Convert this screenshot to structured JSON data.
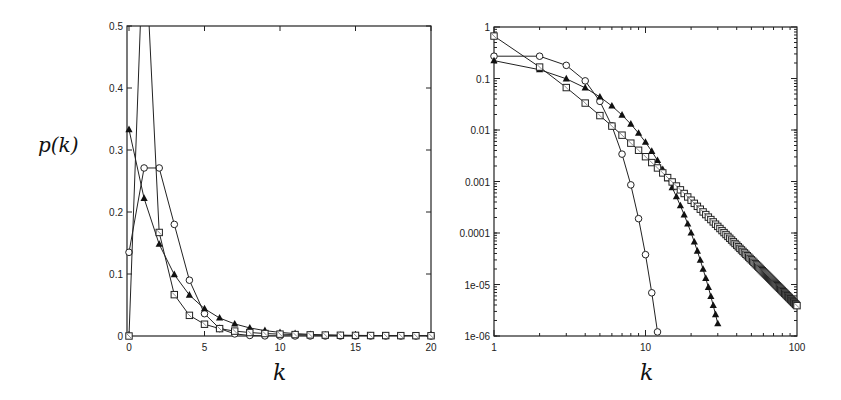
{
  "chart_data": [
    {
      "type": "line",
      "panel": "left",
      "title": "",
      "xlabel": "k",
      "ylabel": "p(k)",
      "xscale": "linear",
      "yscale": "linear",
      "xlim": [
        0,
        20
      ],
      "ylim": [
        0,
        0.5
      ],
      "xticks": [
        "0",
        "5",
        "10",
        "15",
        "20"
      ],
      "yticks": [
        "0",
        "0.1",
        "0.2",
        "0.3",
        "0.4",
        "0.5"
      ],
      "grid": false,
      "legend": null,
      "series": [
        {
          "name": "circles",
          "marker": "circle",
          "x": [
            0,
            1,
            2,
            3,
            4,
            5,
            6,
            7,
            8,
            9,
            10,
            11,
            12,
            13,
            14,
            15,
            16,
            17,
            18,
            19,
            20
          ],
          "values": [
            0.135,
            0.271,
            0.271,
            0.18,
            0.09,
            0.036,
            0.012,
            0.0034,
            0.0009,
            0.0002,
            4e-05,
            1e-05,
            0,
            0,
            0,
            0,
            0,
            0,
            0,
            0,
            0
          ]
        },
        {
          "name": "triangles",
          "marker": "triangle",
          "x": [
            0,
            1,
            2,
            3,
            4,
            5,
            6,
            7,
            8,
            9,
            10,
            11,
            12,
            13,
            14,
            15,
            16,
            17,
            18,
            19,
            20
          ],
          "values": [
            0.333,
            0.222,
            0.148,
            0.099,
            0.066,
            0.044,
            0.029,
            0.0195,
            0.013,
            0.0087,
            0.0058,
            0.0039,
            0.0026,
            0.0017,
            0.0011,
            0.0008,
            0.0005,
            0.0003,
            0.0002,
            0.00015,
            0.0001
          ]
        },
        {
          "name": "squares",
          "marker": "square",
          "x": [
            0,
            1,
            2,
            3,
            4,
            5,
            6,
            7,
            8,
            9,
            10,
            11,
            12,
            13,
            14,
            15,
            16,
            17,
            18,
            19,
            20
          ],
          "values": [
            0,
            0.667,
            0.167,
            0.0667,
            0.0333,
            0.019,
            0.0119,
            0.0079,
            0.0056,
            0.004,
            0.003,
            0.0023,
            0.0018,
            0.0015,
            0.0012,
            0.001,
            0.0008,
            0.0007,
            0.0006,
            0.0005,
            0.0004
          ]
        }
      ]
    },
    {
      "type": "line",
      "panel": "right",
      "title": "",
      "xlabel": "k",
      "ylabel": "",
      "xscale": "log",
      "yscale": "log",
      "xlim": [
        1,
        100
      ],
      "ylim": [
        1e-06,
        1
      ],
      "xticks": [
        "1",
        "10",
        "100"
      ],
      "yticks": [
        "1",
        "0.1",
        "0.01",
        "0.001",
        "0.0001",
        "1e-05",
        "1e-06"
      ],
      "grid": false,
      "legend": null,
      "series": [
        {
          "name": "circles",
          "marker": "circle",
          "x": [
            1,
            2,
            3,
            4,
            5,
            6,
            7,
            8,
            9,
            10,
            11,
            12
          ],
          "values": [
            0.271,
            0.271,
            0.18,
            0.09,
            0.036,
            0.012,
            0.0034,
            0.00086,
            0.00019,
            3.8e-05,
            6.9e-06,
            1.2e-06
          ]
        },
        {
          "name": "triangles",
          "marker": "triangle",
          "x_range": [
            1,
            30
          ],
          "formula": "(1/3)*(2/3)^k",
          "values_note": "geometric decay from 0.222 at k=1 to ~1e-06 at k=30"
        },
        {
          "name": "squares",
          "marker": "square",
          "x_range": [
            1,
            100
          ],
          "formula": "4/(k(k+1)(k+2))",
          "values_note": "power law from 0.667 at k=1 to ~3.9e-06 at k=100"
        }
      ]
    }
  ],
  "labels": {
    "ylabel_left": "p(k)",
    "xlabel_left": "k",
    "xlabel_right": "k"
  }
}
